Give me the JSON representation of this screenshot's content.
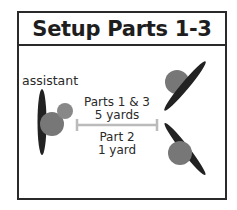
{
  "title": "Setup Parts 1-3",
  "labels": {
    "assistant": "assistant",
    "parts13": "Parts 1 & 3",
    "parts13_distance": "5 yards",
    "part2": "Part 2",
    "part2_distance": "1 yard"
  },
  "colors": {
    "border": "#2a2a2a",
    "paddle": "#222222",
    "player": "#777777",
    "ball": "#888888",
    "distance_bar": "#bbbbbb"
  },
  "figures": [
    {
      "role": "assistant",
      "position": "left",
      "orientation": "vertical"
    },
    {
      "role": "player-top-right",
      "position": "right-top",
      "orientation": "diagonal-up"
    },
    {
      "role": "player-bottom-right",
      "position": "right-bottom",
      "orientation": "diagonal-down"
    }
  ]
}
